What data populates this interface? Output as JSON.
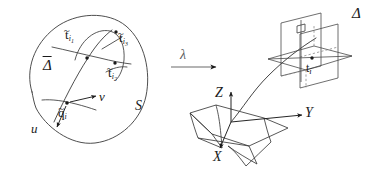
{
  "figure": {
    "type": "mathematical-diagram",
    "background": "#ffffff",
    "ink": "#1a1a1a",
    "width": 378,
    "height": 176
  },
  "left_panel": {
    "name": "parameter-domain",
    "surface_label": "S",
    "curve_label": "Δ",
    "curve_label_accent": "bar",
    "base_point": "q",
    "base_point_accent": "tilde",
    "base_point_subscript": "i",
    "param_u": "u",
    "param_v": "v",
    "marked_points": [
      {
        "symbol": "t",
        "accent": "tilde",
        "subscript": "i",
        "subsubscript": "1",
        "label": "t̃i₁"
      },
      {
        "symbol": "t",
        "accent": "tilde",
        "subscript": "i",
        "subsubscript": "2",
        "label": "t̃i₂"
      },
      {
        "symbol": "t",
        "accent": "tilde",
        "subscript": "i",
        "subsubscript": "3",
        "label": "t̃i₃"
      }
    ]
  },
  "map_arrow": {
    "name": "lambda-map",
    "label": "λ",
    "direction": "right"
  },
  "right_panel": {
    "name": "three-dimensional-space",
    "axes": [
      {
        "name": "x-axis",
        "label": "X"
      },
      {
        "name": "y-axis",
        "label": "Y"
      },
      {
        "name": "z-axis",
        "label": "Z"
      }
    ],
    "curve_label": "Δ",
    "point_label": "t",
    "point_subscript": "i",
    "planes_count": 3
  }
}
